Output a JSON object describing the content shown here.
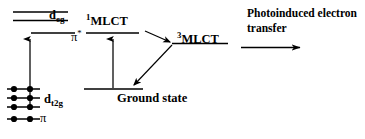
{
  "diagram": {
    "type": "energy-level-jablonski",
    "title": "",
    "stroke_color": "#000000",
    "background_color": "#ffffff",
    "levels": [
      {
        "id": "d_eg_upper",
        "label": "",
        "x1": 13,
        "x2": 68,
        "y": 12
      },
      {
        "id": "d_eg_lower",
        "label": "d",
        "sub": "eg",
        "x1": 13,
        "x2": 68,
        "y": 20
      },
      {
        "id": "pi_star",
        "label": "π",
        "sup": "*",
        "x1": 31,
        "x2": 75,
        "y": 33
      },
      {
        "id": "d_t2g_1",
        "label": "",
        "x1": 7,
        "x2": 40,
        "y": 89
      },
      {
        "id": "d_t2g_2",
        "label": "d",
        "sub": "t2g",
        "x1": 7,
        "x2": 40,
        "y": 98
      },
      {
        "id": "d_t2g_3",
        "label": "",
        "x1": 7,
        "x2": 40,
        "y": 107
      },
      {
        "id": "pi",
        "label": "π",
        "x1": 7,
        "x2": 40,
        "y": 119
      },
      {
        "id": "mlct_singlet",
        "label": "MLCT",
        "sup": "1",
        "x1": 86,
        "x2": 139,
        "y": 33
      },
      {
        "id": "mlct_triplet",
        "label": "MLCT",
        "sup": "3",
        "x1": 172,
        "x2": 228,
        "y": 43
      },
      {
        "id": "ground_state",
        "label": "Ground state",
        "x1": 84,
        "x2": 143,
        "y": 89
      }
    ],
    "electron_pairs": [
      {
        "level": "d_t2g_1",
        "y": 89,
        "dots_x": [
          14,
          30
        ]
      },
      {
        "level": "d_t2g_2",
        "y": 98,
        "dots_x": [
          14,
          30
        ]
      },
      {
        "level": "d_t2g_3",
        "y": 107,
        "dots_x": [
          14,
          30
        ]
      },
      {
        "level": "pi",
        "y": 119,
        "dots_x": [
          14,
          30
        ]
      }
    ],
    "arrows": [
      {
        "id": "metal-excitation-arrow",
        "from": [
          30,
          107
        ],
        "to": [
          30,
          37
        ],
        "kind": "absorption-up"
      },
      {
        "id": "mlct-excitation-arrow",
        "from": [
          113,
          89
        ],
        "to": [
          113,
          37
        ],
        "kind": "absorption-up"
      },
      {
        "id": "isc-arrow",
        "from": [
          146,
          33
        ],
        "to": [
          171,
          43
        ],
        "kind": "intersystem-crossing"
      },
      {
        "id": "decay-arrow",
        "from": [
          171,
          44
        ],
        "to": [
          133,
          86
        ],
        "kind": "relaxation-down"
      },
      {
        "id": "pet-arrow",
        "from": [
          240,
          48
        ],
        "to": [
          303,
          48
        ],
        "kind": "process"
      }
    ]
  },
  "labels": {
    "d_eg": {
      "base": "d",
      "sub": "eg"
    },
    "pi_star": {
      "base": "π",
      "sup": "*"
    },
    "d_t2g": {
      "base": "d",
      "sub": "t2g"
    },
    "pi": {
      "base": "π"
    },
    "mlct_singlet": {
      "sup": "1",
      "base": "MLCT"
    },
    "mlct_triplet": {
      "sup": "3",
      "base": "MLCT"
    },
    "ground_state": "Ground state",
    "photoinduced_transfer": {
      "line1": "Photoinduced electron",
      "line2": "transfer"
    }
  }
}
